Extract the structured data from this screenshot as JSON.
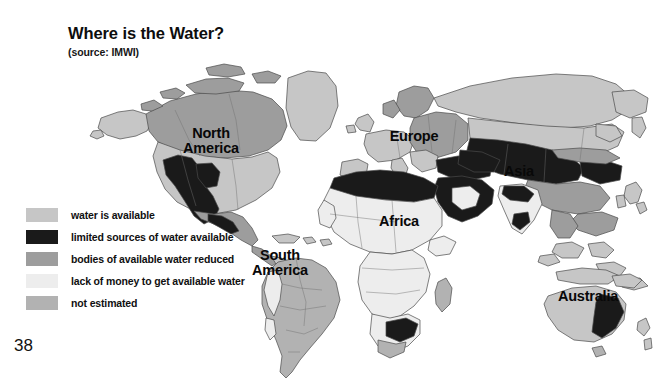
{
  "slide": {
    "title": "Where is the Water?",
    "source": "(source: IMWI)",
    "page_number": "38",
    "background_color": "#ffffff"
  },
  "legend": {
    "items": [
      {
        "label": "water is available",
        "color": "#c6c6c6"
      },
      {
        "label": "limited sources of water available",
        "color": "#1a1a1a"
      },
      {
        "label": "bodies of available water reduced",
        "color": "#9d9d9d"
      },
      {
        "label": "lack of money to get available water",
        "color": "#ededed"
      },
      {
        "label": "not estimated",
        "color": "#b2b2b2"
      }
    ]
  },
  "map": {
    "type": "choropleth-world-map",
    "ocean_color": "#ffffff",
    "border_color": "#4a4a4a",
    "labels": [
      {
        "id": "north-america",
        "text": "North\nAmerica"
      },
      {
        "id": "south-america",
        "text": "South\nAmerica"
      },
      {
        "id": "europe",
        "text": "Europe"
      },
      {
        "id": "asia",
        "text": "Asia"
      },
      {
        "id": "africa",
        "text": "Africa"
      },
      {
        "id": "australia",
        "text": "Australia"
      }
    ]
  }
}
